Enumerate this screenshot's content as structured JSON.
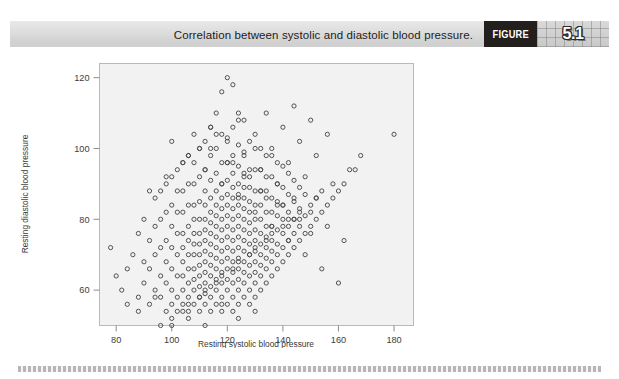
{
  "caption": {
    "text": "Correlation between systolic and diastolic blood pressure.",
    "figure_word": "FIGURE",
    "figure_number": "5.1"
  },
  "colors": {
    "caption_bar": "#dcdcdc",
    "figure_badge_bg": "#231f1d",
    "figure_badge_text": "#ffffff",
    "plot_background": "#f2f2f2",
    "plot_border": "#b9b9b9",
    "marker_stroke": "#4a4a4a",
    "axis": "#8d8d8d",
    "page_background": "#ffffff"
  },
  "chart_data": {
    "type": "scatter",
    "title": "Correlation between systolic and diastolic blood pressure.",
    "xlabel": "Resting systolic blood pressure",
    "ylabel": "Resting diastolic blood pressure",
    "xlim": [
      74,
      187
    ],
    "ylim": [
      50,
      124
    ],
    "xticks": [
      80,
      100,
      120,
      140,
      160,
      180
    ],
    "yticks": [
      60,
      80,
      100,
      120
    ],
    "xticklabels": [
      "80",
      "100",
      "120",
      "140",
      "160",
      "180"
    ],
    "yticklabels": [
      "60",
      "80",
      "100",
      "120"
    ],
    "grid": false,
    "legend": null,
    "marker": "open-circle",
    "marker_size_px": 4.2,
    "series": [
      {
        "name": "participants",
        "description": "Integer-valued blood pressure readings forming a dense positively-correlated cloud centred near (122, 78).",
        "x": [
          78,
          80,
          82,
          84,
          86,
          88,
          88,
          90,
          90,
          90,
          92,
          92,
          92,
          94,
          94,
          94,
          94,
          96,
          96,
          96,
          96,
          96,
          98,
          98,
          98,
          98,
          98,
          98,
          100,
          100,
          100,
          100,
          100,
          100,
          100,
          102,
          102,
          102,
          102,
          102,
          102,
          102,
          102,
          104,
          104,
          104,
          104,
          104,
          104,
          104,
          104,
          104,
          106,
          106,
          106,
          106,
          106,
          106,
          106,
          106,
          106,
          106,
          108,
          108,
          108,
          108,
          108,
          108,
          108,
          108,
          108,
          108,
          108,
          110,
          110,
          110,
          110,
          110,
          110,
          110,
          110,
          110,
          110,
          110,
          110,
          112,
          112,
          112,
          112,
          112,
          112,
          112,
          112,
          112,
          112,
          112,
          112,
          112,
          114,
          114,
          114,
          114,
          114,
          114,
          114,
          114,
          114,
          114,
          114,
          114,
          114,
          114,
          116,
          116,
          116,
          116,
          116,
          116,
          116,
          116,
          116,
          116,
          116,
          116,
          116,
          116,
          118,
          118,
          118,
          118,
          118,
          118,
          118,
          118,
          118,
          118,
          118,
          118,
          118,
          118,
          118,
          120,
          120,
          120,
          120,
          120,
          120,
          120,
          120,
          120,
          120,
          120,
          120,
          120,
          120,
          120,
          122,
          122,
          122,
          122,
          122,
          122,
          122,
          122,
          122,
          122,
          122,
          122,
          122,
          122,
          122,
          122,
          124,
          124,
          124,
          124,
          124,
          124,
          124,
          124,
          124,
          124,
          124,
          124,
          124,
          124,
          124,
          126,
          126,
          126,
          126,
          126,
          126,
          126,
          126,
          126,
          126,
          126,
          126,
          126,
          126,
          128,
          128,
          128,
          128,
          128,
          128,
          128,
          128,
          128,
          128,
          128,
          128,
          128,
          130,
          130,
          130,
          130,
          130,
          130,
          130,
          130,
          130,
          130,
          130,
          130,
          132,
          132,
          132,
          132,
          132,
          132,
          132,
          132,
          132,
          132,
          132,
          134,
          134,
          134,
          134,
          134,
          134,
          134,
          134,
          134,
          134,
          136,
          136,
          136,
          136,
          136,
          136,
          136,
          136,
          136,
          138,
          138,
          138,
          138,
          138,
          138,
          138,
          138,
          140,
          140,
          140,
          140,
          140,
          140,
          140,
          142,
          142,
          142,
          142,
          142,
          142,
          144,
          144,
          144,
          144,
          144,
          146,
          146,
          146,
          146,
          148,
          148,
          148,
          150,
          150,
          152,
          152,
          154,
          156,
          158,
          160,
          162,
          166,
          168,
          180,
          84,
          88,
          94,
          100,
          106,
          112,
          118,
          124,
          130,
          136,
          142,
          96,
          104,
          110,
          116,
          122,
          128,
          134,
          140,
          146,
          152,
          158,
          164,
          92,
          98,
          104,
          110,
          116,
          122,
          128,
          134,
          140,
          146,
          100,
          106,
          112,
          118,
          124,
          130,
          136,
          142,
          148,
          154,
          160,
          108,
          114,
          120,
          126,
          132,
          138,
          144,
          150,
          114,
          120,
          126,
          132,
          138,
          144,
          150,
          156,
          162,
          124,
          130,
          136,
          142,
          148,
          154,
          134,
          140,
          146,
          152,
          144,
          150,
          156,
          118,
          124,
          130,
          112,
          106,
          100
        ],
        "y": [
          72,
          64,
          60,
          56,
          70,
          58,
          76,
          62,
          68,
          80,
          56,
          66,
          74,
          60,
          70,
          78,
          86,
          58,
          64,
          72,
          80,
          88,
          54,
          62,
          68,
          74,
          82,
          90,
          56,
          60,
          66,
          72,
          78,
          84,
          92,
          54,
          58,
          64,
          70,
          76,
          82,
          88,
          94,
          56,
          60,
          64,
          68,
          72,
          76,
          82,
          88,
          96,
          54,
          58,
          62,
          66,
          70,
          74,
          78,
          84,
          90,
          98,
          56,
          60,
          63,
          66,
          70,
          73,
          76,
          80,
          84,
          90,
          96,
          54,
          58,
          61,
          64,
          67,
          70,
          73,
          76,
          80,
          85,
          92,
          100,
          56,
          59,
          62,
          65,
          68,
          71,
          74,
          77,
          80,
          84,
          88,
          94,
          102,
          54,
          58,
          61,
          64,
          67,
          70,
          73,
          76,
          79,
          82,
          86,
          91,
          98,
          106,
          56,
          60,
          63,
          66,
          69,
          72,
          75,
          78,
          81,
          84,
          88,
          93,
          100,
          110,
          54,
          58,
          62,
          65,
          68,
          71,
          74,
          77,
          80,
          83,
          86,
          90,
          96,
          104,
          116,
          56,
          60,
          63,
          66,
          69,
          72,
          75,
          78,
          81,
          84,
          87,
          91,
          96,
          103,
          120,
          54,
          58,
          62,
          65,
          68,
          71,
          74,
          77,
          80,
          83,
          86,
          89,
          93,
          98,
          106,
          118,
          56,
          60,
          63,
          66,
          69,
          72,
          75,
          78,
          81,
          84,
          87,
          90,
          95,
          101,
          110,
          58,
          62,
          65,
          68,
          71,
          74,
          77,
          80,
          83,
          86,
          89,
          93,
          99,
          108,
          56,
          60,
          64,
          67,
          70,
          73,
          76,
          79,
          82,
          85,
          89,
          94,
          102,
          58,
          62,
          65,
          68,
          71,
          74,
          77,
          80,
          84,
          88,
          94,
          100,
          60,
          64,
          67,
          70,
          73,
          76,
          80,
          84,
          88,
          94,
          100,
          62,
          66,
          69,
          72,
          75,
          78,
          82,
          86,
          92,
          98,
          64,
          68,
          71,
          74,
          78,
          82,
          86,
          92,
          98,
          66,
          70,
          73,
          77,
          81,
          85,
          90,
          96,
          68,
          72,
          76,
          80,
          84,
          89,
          95,
          70,
          74,
          78,
          82,
          87,
          93,
          72,
          76,
          80,
          85,
          91,
          74,
          78,
          83,
          89,
          76,
          81,
          87,
          78,
          84,
          80,
          86,
          82,
          84,
          86,
          88,
          90,
          94,
          98,
          104,
          66,
          54,
          58,
          52,
          56,
          60,
          64,
          68,
          72,
          76,
          80,
          50,
          54,
          58,
          62,
          66,
          70,
          74,
          78,
          82,
          86,
          90,
          94,
          88,
          92,
          96,
          100,
          104,
          96,
          92,
          88,
          84,
          80,
          102,
          98,
          94,
          90,
          86,
          82,
          78,
          74,
          70,
          66,
          62,
          104,
          100,
          96,
          92,
          88,
          84,
          80,
          76,
          106,
          102,
          98,
          94,
          90,
          86,
          82,
          78,
          74,
          108,
          104,
          100,
          96,
          92,
          88,
          110,
          106,
          102,
          98,
          112,
          108,
          104,
          56,
          52,
          54,
          50,
          52,
          50
        ]
      }
    ]
  }
}
